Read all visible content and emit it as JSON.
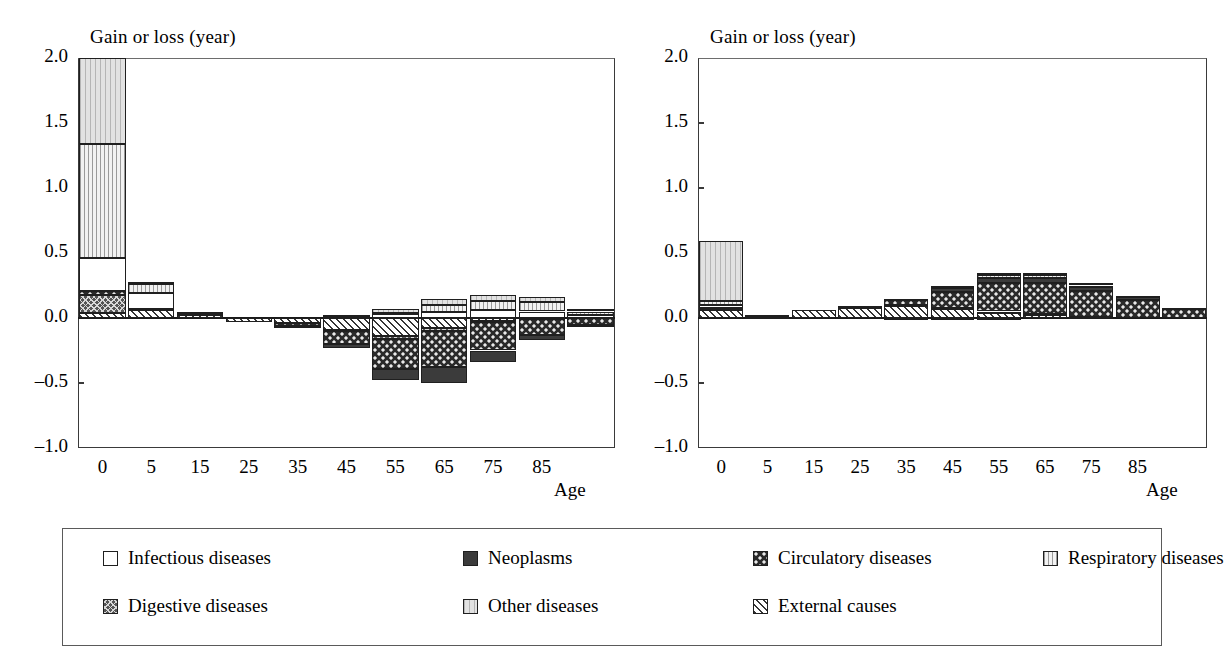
{
  "figure": {
    "axis_y_label": "Gain or loss (year)",
    "axis_x_label": "Age",
    "y_ticks": [
      "2.0",
      "1.5",
      "1.0",
      "0.5",
      "0.0",
      "-0.5",
      "-1.0"
    ],
    "x_ticks": [
      "0",
      "5",
      "15",
      "25",
      "35",
      "45",
      "55",
      "65",
      "75",
      "85"
    ]
  },
  "legend": {
    "items": [
      {
        "label": "Infectious diseases",
        "key": "infectious",
        "color": "#ffffff"
      },
      {
        "label": "Neoplasms",
        "key": "neoplasms",
        "color": "#3b3b3b"
      },
      {
        "label": "Circulatory diseases",
        "key": "circulatory",
        "color": "#2a2a2a"
      },
      {
        "label": "Respiratory diseases",
        "key": "respiratory",
        "color": "#f2f2f2"
      },
      {
        "label": "Digestive diseases",
        "key": "digestive",
        "color": "#555555"
      },
      {
        "label": "Other diseases",
        "key": "other",
        "color": "#e2e2e2"
      },
      {
        "label": "External causes",
        "key": "external",
        "color": "#ffffff"
      }
    ]
  },
  "chart_data": [
    {
      "type": "bar",
      "stacked": true,
      "title": "A. 1965–1991",
      "xlabel": "Age",
      "ylabel": "Gain or loss (year)",
      "ylim": [
        -1.0,
        2.0
      ],
      "ygrid": false,
      "legend_position": "bottom",
      "categories": [
        "0",
        "1-4",
        "5-14",
        "15-24",
        "25-34",
        "35-44",
        "45-54",
        "55-64",
        "65-74",
        "75-84",
        "85+"
      ],
      "x": [
        0,
        5,
        15,
        25,
        35,
        45,
        55,
        65,
        75,
        85,
        90
      ],
      "series": [
        {
          "name": "Infectious diseases",
          "key": "infectious",
          "values": [
            0.25,
            0.12,
            0.02,
            0.0,
            0.0,
            0.01,
            0.03,
            0.05,
            0.06,
            0.05,
            0.02
          ]
        },
        {
          "name": "Neoplasms",
          "key": "neoplasms",
          "values": [
            0.0,
            0.0,
            0.0,
            0.0,
            -0.01,
            -0.03,
            -0.09,
            -0.12,
            -0.09,
            -0.04,
            -0.01
          ]
        },
        {
          "name": "Circulatory diseases",
          "key": "circulatory",
          "values": [
            0.03,
            0.0,
            0.0,
            0.0,
            -0.02,
            -0.1,
            -0.23,
            -0.28,
            -0.22,
            -0.12,
            -0.05
          ]
        },
        {
          "name": "Respiratory diseases",
          "key": "respiratory",
          "values": [
            0.88,
            0.07,
            0.0,
            0.0,
            0.0,
            0.0,
            0.01,
            0.05,
            0.07,
            0.07,
            0.03
          ]
        },
        {
          "name": "Digestive diseases",
          "key": "digestive",
          "values": [
            0.14,
            0.01,
            0.0,
            0.0,
            0.0,
            -0.01,
            -0.02,
            -0.02,
            -0.01,
            0.0,
            0.0
          ]
        },
        {
          "name": "Other diseases",
          "key": "other",
          "values": [
            0.66,
            0.02,
            0.01,
            0.0,
            0.0,
            0.01,
            0.03,
            0.05,
            0.05,
            0.04,
            0.02
          ]
        },
        {
          "name": "External causes",
          "key": "external",
          "values": [
            0.04,
            0.06,
            0.02,
            -0.03,
            -0.04,
            -0.09,
            -0.14,
            -0.08,
            -0.02,
            -0.01,
            0.0
          ]
        }
      ],
      "totals": [
        2.0,
        0.28,
        0.05,
        -0.03,
        -0.07,
        -0.21,
        -0.41,
        -0.35,
        -0.16,
        -0.01,
        0.01
      ]
    },
    {
      "type": "bar",
      "stacked": true,
      "title": "B. 1991–2003",
      "xlabel": "Age",
      "ylabel": "Gain or loss (year)",
      "ylim": [
        -1.0,
        2.0
      ],
      "ygrid": false,
      "legend_position": "bottom",
      "categories": [
        "0",
        "1-4",
        "5-14",
        "15-24",
        "25-34",
        "35-44",
        "45-54",
        "55-64",
        "65-74",
        "75-84",
        "85+"
      ],
      "x": [
        0,
        5,
        15,
        25,
        35,
        45,
        55,
        65,
        75,
        85,
        90
      ],
      "series": [
        {
          "name": "Infectious diseases",
          "key": "infectious",
          "values": [
            0.02,
            0.0,
            0.0,
            0.0,
            -0.01,
            -0.01,
            -0.01,
            0.0,
            0.0,
            0.0,
            0.0
          ]
        },
        {
          "name": "Neoplasms",
          "key": "neoplasms",
          "values": [
            0.0,
            0.0,
            0.0,
            0.0,
            0.01,
            0.03,
            0.04,
            0.04,
            0.03,
            0.02,
            0.01
          ]
        },
        {
          "name": "Circulatory diseases",
          "key": "circulatory",
          "values": [
            0.01,
            0.0,
            0.0,
            0.01,
            0.04,
            0.12,
            0.22,
            0.24,
            0.2,
            0.14,
            0.07
          ]
        },
        {
          "name": "Respiratory diseases",
          "key": "respiratory",
          "values": [
            0.03,
            0.0,
            0.0,
            0.0,
            0.0,
            0.01,
            0.02,
            0.02,
            0.01,
            0.0,
            0.0
          ]
        },
        {
          "name": "Digestive diseases",
          "key": "digestive",
          "values": [
            0.01,
            0.0,
            0.0,
            0.0,
            0.01,
            0.01,
            0.01,
            0.01,
            0.0,
            0.0,
            0.0
          ]
        },
        {
          "name": "Other diseases",
          "key": "other",
          "values": [
            0.46,
            0.01,
            0.0,
            0.0,
            0.0,
            0.01,
            0.02,
            0.02,
            0.02,
            0.01,
            0.0
          ]
        },
        {
          "name": "External causes",
          "key": "external",
          "values": [
            0.06,
            0.01,
            0.06,
            0.08,
            0.09,
            0.07,
            0.04,
            0.02,
            0.01,
            0.0,
            0.0
          ]
        }
      ],
      "totals": [
        0.59,
        0.02,
        0.06,
        0.09,
        0.14,
        0.24,
        0.34,
        0.35,
        0.27,
        0.17,
        0.08
      ]
    }
  ]
}
